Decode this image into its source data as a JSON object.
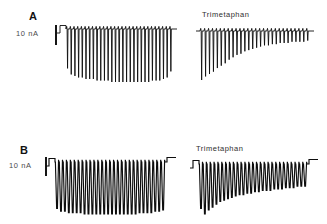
{
  "figure": {
    "background_color": "#ffffff",
    "trace_color": "#0d0d0d",
    "width": 327,
    "height": 224
  },
  "panels": [
    {
      "id": "a",
      "letter": "A",
      "scale_bar_label": "10 nA",
      "scale_bar_value": 10,
      "scale_bar_units": "nA",
      "drug_label": "Trimetaphan",
      "traces": [
        {
          "name": "control",
          "region": {
            "x": 57,
            "y": 22,
            "width": 120,
            "height": 62
          },
          "baseline_y": 7,
          "spike_count": 29,
          "onset_step": true,
          "spike_depths_nA": [
            26,
            30,
            31,
            32,
            32,
            33,
            33,
            33,
            34,
            34,
            34,
            34,
            35,
            35,
            35,
            35,
            35,
            35,
            35,
            35,
            35,
            35,
            35,
            34,
            34,
            34,
            33,
            32,
            28
          ]
        },
        {
          "name": "trimetaphan",
          "region": {
            "x": 196,
            "y": 24,
            "width": 118,
            "height": 58
          },
          "baseline_y": 7,
          "spike_count": 28,
          "onset_step": false,
          "spike_depths_nA": [
            41,
            38,
            36,
            34,
            31,
            29,
            27,
            24,
            22,
            20,
            19,
            17,
            16,
            15,
            14,
            13,
            12,
            12,
            11,
            11,
            10,
            10,
            10,
            9,
            9,
            9,
            9,
            8
          ]
        }
      ]
    },
    {
      "id": "b",
      "letter": "B",
      "scale_bar_label": "10 nA",
      "scale_bar_value": 10,
      "scale_bar_units": "nA",
      "drug_label": "Trimetaphan",
      "traces": [
        {
          "name": "control",
          "region": {
            "x": 46,
            "y": 42,
            "width": 130,
            "height": 62
          },
          "baseline_y": 8,
          "spike_count": 28,
          "onset_step": true,
          "offset_step": true,
          "spike_depths_nA": [
            34,
            36,
            36,
            37,
            37,
            37,
            37,
            38,
            38,
            38,
            38,
            38,
            38,
            38,
            38,
            38,
            38,
            38,
            38,
            38,
            38,
            37,
            37,
            37,
            37,
            36,
            36,
            35
          ]
        },
        {
          "name": "trimetaphan",
          "region": {
            "x": 190,
            "y": 44,
            "width": 128,
            "height": 60
          },
          "baseline_y": 8,
          "spike_count": 28,
          "onset_step": true,
          "offset_step": true,
          "spike_depths_nA": [
            32,
            36,
            33,
            31,
            29,
            27,
            26,
            25,
            24,
            23,
            22,
            22,
            21,
            21,
            20,
            20,
            19,
            19,
            19,
            18,
            18,
            18,
            17,
            17,
            17,
            16,
            16,
            16
          ]
        }
      ]
    }
  ]
}
